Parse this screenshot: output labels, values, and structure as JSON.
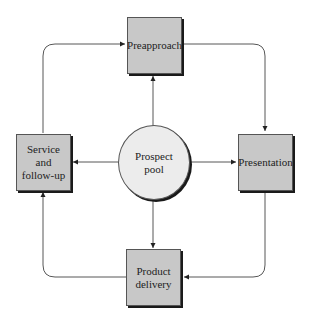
{
  "diagram": {
    "type": "flow-cycle",
    "center": {
      "id": "prospect_pool",
      "label": "Prospect\npool"
    },
    "nodes": {
      "preapproach": {
        "label": "Preapproach"
      },
      "presentation": {
        "label": "Presentation"
      },
      "product_delivery": {
        "label": "Product\ndelivery"
      },
      "service_followup": {
        "label": "Service\nand\nfollow-up"
      }
    },
    "edges": [
      {
        "from": "Prospect pool",
        "to": "Preapproach"
      },
      {
        "from": "Prospect pool",
        "to": "Presentation"
      },
      {
        "from": "Prospect pool",
        "to": "Product delivery"
      },
      {
        "from": "Prospect pool",
        "to": "Service and follow-up"
      },
      {
        "from": "Preapproach",
        "to": "Presentation"
      },
      {
        "from": "Presentation",
        "to": "Product delivery"
      },
      {
        "from": "Product delivery",
        "to": "Service and follow-up"
      },
      {
        "from": "Service and follow-up",
        "to": "Preapproach"
      }
    ],
    "colors": {
      "box_fill": "#c8c8c8",
      "circle_fill": "#ececec",
      "line": "#444444"
    }
  }
}
